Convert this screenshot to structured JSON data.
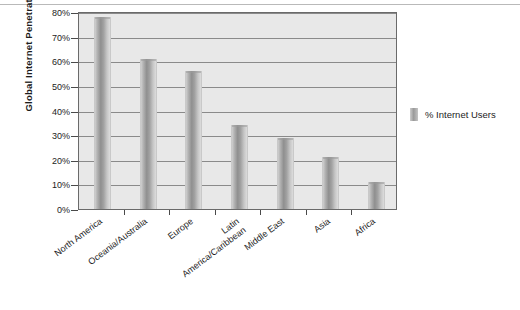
{
  "chart_data": {
    "type": "bar",
    "title": "",
    "xlabel": "",
    "ylabel": "Global Internet Penetration Rates",
    "ylim": [
      0,
      80
    ],
    "grid": true,
    "legend_position": "right",
    "categories": [
      "North America",
      "Oceania/Australia",
      "Europe",
      "Latin America/Caribbean",
      "Middle East",
      "Asia",
      "Africa"
    ],
    "category_lines": [
      [
        "North America"
      ],
      [
        "Oceania/Australia"
      ],
      [
        "Europe"
      ],
      [
        "Latin",
        "America/Caribbean"
      ],
      [
        "Middle East"
      ],
      [
        "Asia"
      ],
      [
        "Africa"
      ]
    ],
    "series": [
      {
        "name": "% Internet Users",
        "values": [
          78,
          61,
          56,
          34,
          29,
          21,
          11
        ]
      }
    ],
    "ytick_labels": [
      "80%",
      "70%",
      "60%",
      "50%",
      "40%",
      "30%",
      "20%",
      "10%",
      "0%"
    ],
    "ytick_values": [
      80,
      70,
      60,
      50,
      40,
      30,
      20,
      10,
      0
    ]
  },
  "legend": {
    "label": "% Internet Users",
    "swatch": "bar-swatch-icon"
  },
  "colors": {
    "plot_background": "#e8e8e8",
    "gridline": "#8a8a8a",
    "bar_mid": "#8f8f8f",
    "axis": "#4a4a4a",
    "text": "#1c1c1c",
    "page_background": "#ffffff"
  }
}
